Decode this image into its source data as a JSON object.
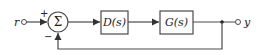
{
  "diagram": {
    "type": "feedback-block-diagram",
    "input_label": "r",
    "output_label": "y",
    "summing_junction": {
      "symbol": "Σ",
      "plus_sign": "+",
      "minus_sign": "−"
    },
    "blocks": [
      {
        "label": "D(s)"
      },
      {
        "label": "G(s)"
      }
    ],
    "colors": {
      "line": "#4a4a4a",
      "text": "#222222",
      "background": "#ffffff"
    }
  }
}
